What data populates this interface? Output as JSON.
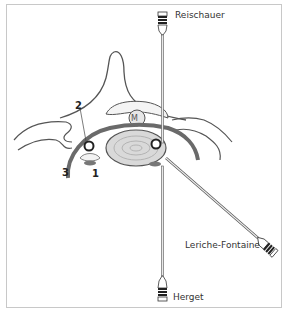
{
  "diagram": {
    "type": "anatomical cross-section with instrument approaches",
    "structure_numbers": [
      {
        "id": "1",
        "label": "1"
      },
      {
        "id": "2",
        "label": "2"
      },
      {
        "id": "3",
        "label": "3"
      }
    ],
    "instruments": [
      {
        "name": "Reischauer",
        "position": "top"
      },
      {
        "name": "Leriche-Fontaine",
        "position": "lower-right"
      },
      {
        "name": "Herget",
        "position": "bottom"
      }
    ],
    "colors": {
      "outline": "#555555",
      "dark_band": "#666666",
      "body_fill": "#d9d9d9",
      "frame_border": "#c8c8c8"
    }
  }
}
